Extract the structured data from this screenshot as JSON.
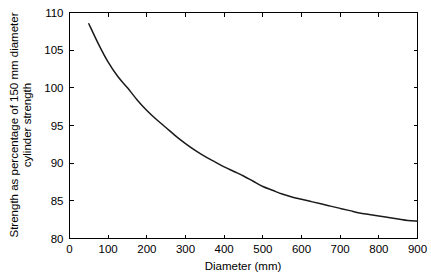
{
  "chart_data": {
    "type": "line",
    "title": "",
    "xlabel": "Diameter (mm)",
    "ylabel": "Strength as percentage of 150 mm diameter cylinder strength",
    "ylabel_line1": "Strength as percentage of 150 mm diameter",
    "ylabel_line2": "cylinder strength",
    "xlim": [
      0,
      900
    ],
    "ylim": [
      80,
      110
    ],
    "xticks": [
      0,
      100,
      200,
      300,
      400,
      500,
      600,
      700,
      800,
      900
    ],
    "yticks": [
      80,
      85,
      90,
      95,
      100,
      105,
      110
    ],
    "xtick_labels": [
      "0",
      "100",
      "200",
      "300",
      "400",
      "500",
      "600",
      "700",
      "800",
      "900"
    ],
    "ytick_labels": [
      "80",
      "85",
      "90",
      "95",
      "100",
      "105",
      "110"
    ],
    "grid": false,
    "legend": null,
    "tick_direction": "in",
    "frame": "box",
    "series": [
      {
        "name": "Strength ratio vs diameter",
        "color": "#1a1a1a",
        "x": [
          50,
          75,
          100,
          125,
          150,
          175,
          200,
          225,
          250,
          275,
          300,
          325,
          350,
          375,
          400,
          425,
          450,
          475,
          500,
          525,
          550,
          575,
          600,
          625,
          650,
          675,
          700,
          725,
          750,
          775,
          800,
          825,
          850,
          875,
          900
        ],
        "y": [
          108.5,
          105.8,
          103.4,
          101.5,
          100.0,
          98.4,
          97.0,
          95.8,
          94.7,
          93.6,
          92.6,
          91.7,
          90.9,
          90.2,
          89.5,
          88.9,
          88.3,
          87.6,
          86.9,
          86.4,
          85.9,
          85.5,
          85.2,
          84.9,
          84.6,
          84.3,
          84.0,
          83.7,
          83.4,
          83.2,
          83.0,
          82.8,
          82.6,
          82.4,
          82.3
        ]
      }
    ]
  }
}
